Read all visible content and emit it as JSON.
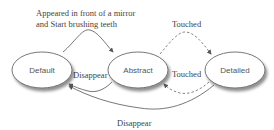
{
  "diagram": {
    "type": "state-diagram",
    "nodes": [
      {
        "id": "default",
        "label": "Default"
      },
      {
        "id": "abstract",
        "label": "Abstract"
      },
      {
        "id": "detailed",
        "label": "Detailed"
      }
    ],
    "edges": [
      {
        "from": "default",
        "to": "abstract",
        "style": "solid",
        "label_line1": "Appeared in front of a mirror",
        "label_line2": "and Start brushing teeth"
      },
      {
        "from": "abstract",
        "to": "detailed",
        "style": "dashed",
        "label": "Touched"
      },
      {
        "from": "detailed",
        "to": "abstract",
        "style": "dashed",
        "label": "Touched"
      },
      {
        "from": "abstract",
        "to": "default",
        "style": "solid",
        "label": "Disappear"
      },
      {
        "from": "detailed",
        "to": "default",
        "style": "solid",
        "label": "Disappear"
      }
    ],
    "colors": {
      "stroke": "#555555",
      "fill": "#ffffff",
      "shadow": "#bbbbbb"
    }
  }
}
